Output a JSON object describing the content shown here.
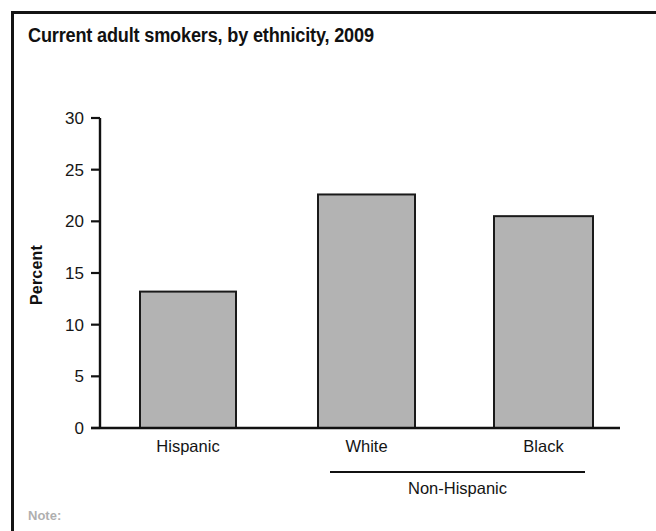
{
  "figure": {
    "title": "Current adult smokers, by ethnicity, 2009",
    "frame_color": "#141414",
    "background": "#ffffff",
    "footnote_partial": "Note:"
  },
  "chart_data": {
    "type": "bar",
    "title": "Current adult smokers, by ethnicity, 2009",
    "categories": [
      "Hispanic",
      "White",
      "Black"
    ],
    "values": [
      13.2,
      22.6,
      20.5
    ],
    "xlabel": "",
    "ylabel": "Percent",
    "ylim": [
      0,
      30
    ],
    "yticks": [
      0,
      5,
      10,
      15,
      20,
      25,
      30
    ],
    "ytick_labels": [
      "0",
      "5",
      "10",
      "15",
      "20",
      "25",
      "30"
    ],
    "grid": false,
    "legend": "none",
    "bar_color": "#b3b3b3",
    "bar_edge_color": "#1a1a1a",
    "group_bracket": {
      "label": "Non-Hispanic",
      "members": [
        "White",
        "Black"
      ]
    }
  },
  "geometry": {
    "plot_left": 100,
    "plot_right": 620,
    "plot_top": 118,
    "plot_bottom": 428,
    "bars": [
      {
        "x": 140,
        "width": 96
      },
      {
        "x": 318,
        "width": 97
      },
      {
        "x": 494,
        "width": 99
      }
    ],
    "category_label_y": 452,
    "bracket_y": 472,
    "bracket_x1": 330,
    "bracket_x2": 585,
    "group_label_y": 494,
    "axis_title_x": 42,
    "axis_title_y": 275
  }
}
